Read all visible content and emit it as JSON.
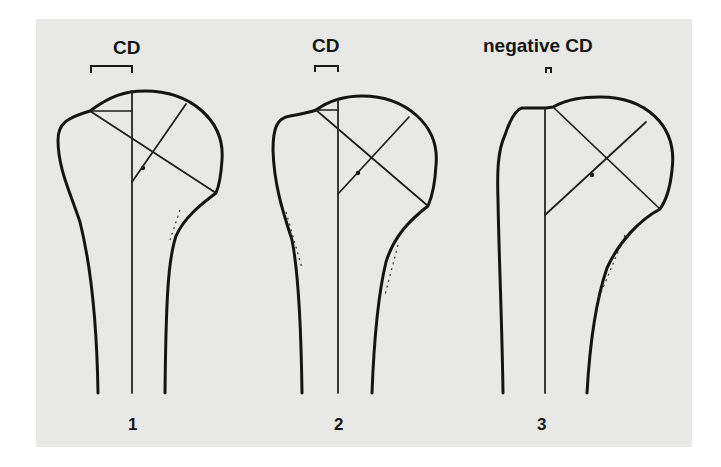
{
  "figure": {
    "background_color": "#e8e8e6",
    "line_color": "#141414",
    "panels": [
      {
        "id": 1,
        "number_label": "1",
        "header_label": "CD",
        "description": "positive critical distance, large"
      },
      {
        "id": 2,
        "number_label": "2",
        "header_label": "CD",
        "description": "positive critical distance, small"
      },
      {
        "id": 3,
        "number_label": "3",
        "header_label": "negative CD",
        "description": "negative critical distance"
      }
    ]
  }
}
